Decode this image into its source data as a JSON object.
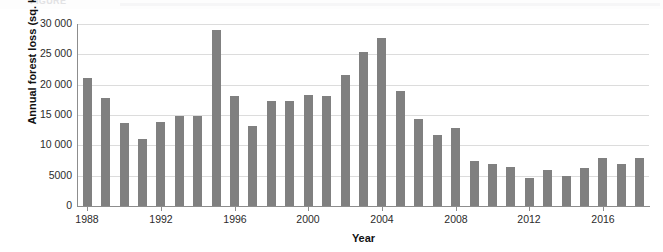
{
  "caption": {
    "text": "FIGURE"
  },
  "chart_data": {
    "type": "bar",
    "title": "",
    "xlabel": "Year",
    "ylabel": "Annual forest loss (sq. km)",
    "ylim": [
      0,
      30000
    ],
    "ytick_values": [
      0,
      5000,
      10000,
      15000,
      20000,
      25000,
      30000
    ],
    "ytick_labels": [
      "0",
      "5000",
      "10 000",
      "15 000",
      "20 000",
      "25 000",
      "30 000"
    ],
    "xtick_labels": [
      "1988",
      "1992",
      "1996",
      "2000",
      "2004",
      "2008",
      "2012",
      "2016"
    ],
    "grid": true,
    "legend": "none",
    "bar_color": "#808080",
    "categories": [
      "1988",
      "1989",
      "1990",
      "1991",
      "1992",
      "1993",
      "1994",
      "1995",
      "1996",
      "1997",
      "1998",
      "1999",
      "2000",
      "2001",
      "2002",
      "2003",
      "2004",
      "2005",
      "2006",
      "2007",
      "2008",
      "2009",
      "2010",
      "2011",
      "2012",
      "2013",
      "2014",
      "2015",
      "2016",
      "2017",
      "2018"
    ],
    "values": [
      21050,
      17770,
      13730,
      11030,
      13790,
      14900,
      14900,
      29060,
      18160,
      13230,
      17380,
      17260,
      18230,
      18170,
      21650,
      25400,
      27770,
      19010,
      14290,
      11650,
      12910,
      7460,
      7000,
      6420,
      4570,
      5890,
      5010,
      6210,
      7890,
      6950,
      7900
    ]
  }
}
